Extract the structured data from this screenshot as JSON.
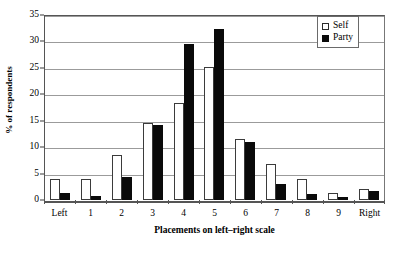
{
  "chart_data": {
    "type": "bar",
    "title": "",
    "xlabel": "Placements on left–right scale",
    "ylabel": "% of respondents",
    "ylim": [
      0,
      35
    ],
    "ytick_step": 5,
    "yticks": [
      0,
      5,
      10,
      15,
      20,
      25,
      30,
      35
    ],
    "ytick_labels": [
      "0",
      "5",
      "10",
      "15",
      "20",
      "25",
      "30",
      "35"
    ],
    "grid": true,
    "grid_axis": "y",
    "legend_position": "top-right",
    "categories": [
      "Left",
      "1",
      "2",
      "3",
      "4",
      "5",
      "6",
      "7",
      "8",
      "9",
      "Right"
    ],
    "series": [
      {
        "name": "Self",
        "color": "#ffffff",
        "edge_color": "#3b3b3b",
        "values": [
          3.9,
          3.9,
          8.6,
          14.5,
          18.3,
          25.1,
          11.5,
          6.8,
          3.9,
          1.3,
          2.0
        ]
      },
      {
        "name": "Party",
        "color": "#0a0a0a",
        "edge_color": "#0a0a0a",
        "values": [
          1.3,
          0.8,
          4.4,
          14.1,
          29.5,
          32.4,
          10.9,
          3.1,
          1.1,
          0.5,
          1.8
        ]
      }
    ]
  },
  "legend": {
    "entries": [
      {
        "label": "Self"
      },
      {
        "label": "Party"
      }
    ]
  },
  "colors": {
    "grid": "#9b9b9b",
    "axis": "#555555",
    "self_fill": "#ffffff",
    "party_fill": "#0a0a0a",
    "background": "#ffffff"
  }
}
